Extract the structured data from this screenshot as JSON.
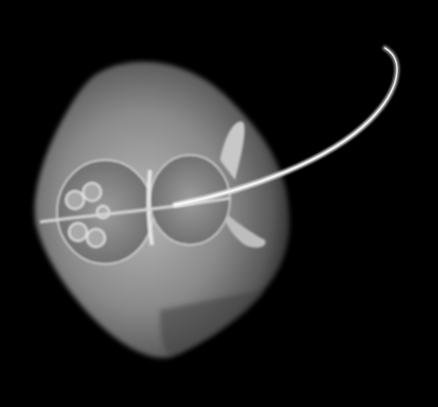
{
  "image": {
    "subject": "X-ray of a stingray (dorsal view)",
    "background_color": "#000000",
    "body_color": "#9a9a9a",
    "highlight_color": "#f0f0f0",
    "width": 438,
    "height": 407
  }
}
